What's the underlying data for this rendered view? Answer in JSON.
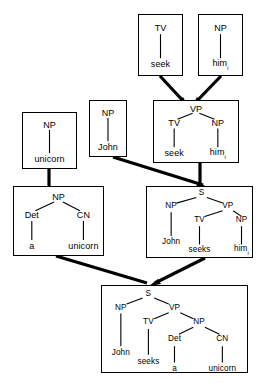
{
  "diagram": {
    "style": {
      "line_color": "#000000",
      "box_border_color": "#000000",
      "background": "#ffffff",
      "edge_color": "#000000"
    },
    "boxes": [
      {
        "id": "box-tv-seek",
        "name": "tree-box-tv-seek",
        "nodes": [
          {
            "id": "n1",
            "label": "TV",
            "kind": "category",
            "x": 50,
            "y": 22
          },
          {
            "id": "n2",
            "label": "seek",
            "kind": "leaf",
            "x": 50,
            "y": 82
          }
        ],
        "branches": [
          [
            "n1",
            "n2"
          ]
        ]
      },
      {
        "id": "box-np-him",
        "name": "tree-box-np-him",
        "nodes": [
          {
            "id": "n1",
            "label": "NP",
            "kind": "category",
            "x": 50,
            "y": 22
          },
          {
            "id": "n2",
            "label": "him",
            "sub": "i",
            "kind": "leaf",
            "x": 50,
            "y": 82
          }
        ],
        "branches": [
          [
            "n1",
            "n2"
          ]
        ]
      },
      {
        "id": "box-np-unicorn",
        "name": "tree-box-np-unicorn",
        "nodes": [
          {
            "id": "n1",
            "label": "NP",
            "kind": "category",
            "x": 50,
            "y": 21
          },
          {
            "id": "n2",
            "label": "unicorn",
            "kind": "leaf",
            "x": 50,
            "y": 83
          }
        ],
        "branches": [
          [
            "n1",
            "n2"
          ]
        ]
      },
      {
        "id": "box-np-john",
        "name": "tree-box-np-john",
        "nodes": [
          {
            "id": "n1",
            "label": "NP",
            "kind": "category",
            "x": 50,
            "y": 21
          },
          {
            "id": "n2",
            "label": "John",
            "kind": "leaf",
            "x": 50,
            "y": 83
          }
        ],
        "branches": [
          [
            "n1",
            "n2"
          ]
        ]
      },
      {
        "id": "box-vp",
        "name": "tree-box-vp",
        "nodes": [
          {
            "id": "n1",
            "label": "VP",
            "kind": "category",
            "x": 50,
            "y": 13
          },
          {
            "id": "n2",
            "label": "TV",
            "kind": "category",
            "x": 24,
            "y": 36
          },
          {
            "id": "n3",
            "label": "NP",
            "kind": "category",
            "x": 76,
            "y": 36
          },
          {
            "id": "n4",
            "label": "seek",
            "kind": "leaf",
            "x": 24,
            "y": 85
          },
          {
            "id": "n5",
            "label": "him",
            "sub": "i",
            "kind": "leaf",
            "x": 76,
            "y": 85
          }
        ],
        "branches": [
          [
            "n1",
            "n2"
          ],
          [
            "n1",
            "n3"
          ],
          [
            "n2",
            "n4"
          ],
          [
            "n3",
            "n5"
          ]
        ]
      },
      {
        "id": "box-np-det-cn",
        "name": "tree-box-np-det-cn",
        "nodes": [
          {
            "id": "n1",
            "label": "NP",
            "kind": "category",
            "x": 50,
            "y": 15
          },
          {
            "id": "n2",
            "label": "Det",
            "kind": "category",
            "x": 20,
            "y": 41
          },
          {
            "id": "n3",
            "label": "CN",
            "kind": "category",
            "x": 78,
            "y": 41
          },
          {
            "id": "n4",
            "label": "a",
            "kind": "leaf",
            "x": 20,
            "y": 86
          },
          {
            "id": "n5",
            "label": "unicorn",
            "kind": "leaf",
            "x": 78,
            "y": 86
          }
        ],
        "branches": [
          [
            "n1",
            "n2"
          ],
          [
            "n1",
            "n3"
          ],
          [
            "n2",
            "n4"
          ],
          [
            "n3",
            "n5"
          ]
        ]
      },
      {
        "id": "box-s-him",
        "name": "tree-box-s-john-seeks-him",
        "nodes": [
          {
            "id": "n1",
            "label": "S",
            "kind": "category",
            "x": 52,
            "y": 9
          },
          {
            "id": "n2",
            "label": "NP",
            "kind": "category",
            "x": 23,
            "y": 27
          },
          {
            "id": "n3",
            "label": "VP",
            "kind": "category",
            "x": 77,
            "y": 27
          },
          {
            "id": "n4",
            "label": "TV",
            "kind": "category",
            "x": 50,
            "y": 47
          },
          {
            "id": "n5",
            "label": "NP",
            "kind": "category",
            "x": 90,
            "y": 47
          },
          {
            "id": "n6",
            "label": "John",
            "kind": "leaf",
            "x": 23,
            "y": 78
          },
          {
            "id": "n7",
            "label": "seeks",
            "kind": "leaf",
            "x": 50,
            "y": 90
          },
          {
            "id": "n8",
            "label": "him",
            "sub": "i",
            "kind": "leaf",
            "x": 90,
            "y": 90
          }
        ],
        "branches": [
          [
            "n1",
            "n2"
          ],
          [
            "n1",
            "n3"
          ],
          [
            "n3",
            "n4"
          ],
          [
            "n3",
            "n5"
          ],
          [
            "n2",
            "n6"
          ],
          [
            "n4",
            "n7"
          ],
          [
            "n5",
            "n8"
          ]
        ]
      },
      {
        "id": "box-s-unicorn",
        "name": "tree-box-s-john-seeks-a-unicorn",
        "nodes": [
          {
            "id": "n1",
            "label": "S",
            "kind": "category",
            "x": 32,
            "y": 9
          },
          {
            "id": "n2",
            "label": "NP",
            "kind": "category",
            "x": 13,
            "y": 25
          },
          {
            "id": "n3",
            "label": "VP",
            "kind": "category",
            "x": 50,
            "y": 25
          },
          {
            "id": "n4",
            "label": "TV",
            "kind": "category",
            "x": 32,
            "y": 42
          },
          {
            "id": "n5",
            "label": "NP",
            "kind": "category",
            "x": 67,
            "y": 42
          },
          {
            "id": "n6",
            "label": "Det",
            "kind": "category",
            "x": 50,
            "y": 62
          },
          {
            "id": "n7",
            "label": "CN",
            "kind": "category",
            "x": 83,
            "y": 62
          },
          {
            "id": "n8",
            "label": "John",
            "kind": "leaf",
            "x": 13,
            "y": 78
          },
          {
            "id": "n9",
            "label": "seeks",
            "kind": "leaf",
            "x": 32,
            "y": 88
          },
          {
            "id": "n10",
            "label": "a",
            "kind": "leaf",
            "x": 50,
            "y": 96
          },
          {
            "id": "n11",
            "label": "unicorn",
            "kind": "leaf",
            "x": 83,
            "y": 96
          }
        ],
        "branches": [
          [
            "n1",
            "n2"
          ],
          [
            "n1",
            "n3"
          ],
          [
            "n3",
            "n4"
          ],
          [
            "n3",
            "n5"
          ],
          [
            "n5",
            "n6"
          ],
          [
            "n5",
            "n7"
          ],
          [
            "n2",
            "n8"
          ],
          [
            "n4",
            "n9"
          ],
          [
            "n6",
            "n10"
          ],
          [
            "n7",
            "n11"
          ]
        ]
      }
    ],
    "connectors": [
      {
        "name": "connector-tv-seek-to-vp",
        "from": "box-tv-seek",
        "to": "box-vp"
      },
      {
        "name": "connector-np-him-to-vp",
        "from": "box-np-him",
        "to": "box-vp"
      },
      {
        "name": "connector-np-unicorn-to-det-cn",
        "from": "box-np-unicorn",
        "to": "box-np-det-cn"
      },
      {
        "name": "connector-np-john-to-s",
        "from": "box-np-john",
        "to": "box-s-him"
      },
      {
        "name": "connector-vp-to-s",
        "from": "box-vp",
        "to": "box-s-him"
      },
      {
        "name": "connector-det-cn-to-s-unicorn",
        "from": "box-np-det-cn",
        "to": "box-s-unicorn"
      },
      {
        "name": "connector-s-him-to-s-unicorn",
        "from": "box-s-him",
        "to": "box-s-unicorn"
      }
    ]
  }
}
